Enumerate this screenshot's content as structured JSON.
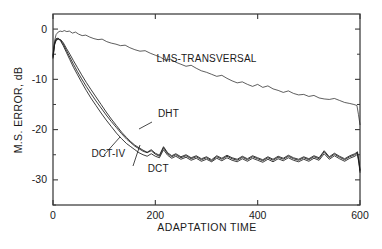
{
  "chart_data": {
    "type": "line",
    "title": "",
    "xlabel": "ADAPTATION TIME",
    "ylabel": "M.S. ERROR, dB",
    "xlim": [
      0,
      600
    ],
    "ylim": [
      -35,
      3
    ],
    "grid": false,
    "legend_position": "inline-annotations",
    "x_ticks": [
      0,
      200,
      400,
      600
    ],
    "x_tick_labels": [
      "0",
      "200",
      "400",
      "600"
    ],
    "y_ticks": [
      0,
      -10,
      -20,
      -30
    ],
    "y_tick_labels": [
      "0",
      "-10",
      "-20",
      "-30"
    ],
    "y_minor_ticks": [
      -5,
      -15,
      -25,
      -35
    ],
    "annotations": [
      {
        "text": "LMS-TRANSVERSAL",
        "x": 300,
        "y": -6.5
      },
      {
        "text": "DHT",
        "x": 205,
        "y": -17.5
      },
      {
        "text": "DCT-IV",
        "x": 75,
        "y": -25.5
      },
      {
        "text": "DCT",
        "x": 185,
        "y": -28.5
      }
    ],
    "series": [
      {
        "name": "LMS-TRANSVERSAL",
        "x": [
          0,
          3,
          6,
          10,
          14,
          18,
          22,
          27,
          32,
          38,
          44,
          50,
          57,
          64,
          72,
          80,
          88,
          96,
          105,
          114,
          123,
          132,
          141,
          150,
          160,
          170,
          180,
          190,
          200,
          210,
          220,
          230,
          240,
          250,
          260,
          270,
          280,
          290,
          300,
          310,
          320,
          330,
          340,
          350,
          360,
          370,
          380,
          390,
          400,
          410,
          420,
          430,
          440,
          450,
          460,
          470,
          480,
          490,
          500,
          510,
          520,
          530,
          540,
          550,
          560,
          570,
          580,
          588,
          594,
          597,
          600
        ],
        "values": [
          -5.2,
          -2.4,
          -1.1,
          -0.6,
          -0.4,
          -0.5,
          -0.3,
          -0.5,
          -0.4,
          -0.8,
          -0.6,
          -1.0,
          -1.3,
          -1.2,
          -1.6,
          -1.9,
          -2.1,
          -2.0,
          -2.5,
          -2.8,
          -3.0,
          -3.3,
          -3.2,
          -3.7,
          -4.1,
          -4.4,
          -4.3,
          -4.8,
          -5.2,
          -5.6,
          -6.2,
          -6.0,
          -6.6,
          -7.0,
          -7.4,
          -7.2,
          -7.8,
          -8.3,
          -8.6,
          -9.0,
          -9.4,
          -9.2,
          -9.8,
          -10.3,
          -10.7,
          -10.5,
          -11.0,
          -11.4,
          -11.0,
          -11.6,
          -11.3,
          -11.9,
          -12.2,
          -12.6,
          -12.3,
          -12.8,
          -13.1,
          -13.0,
          -13.4,
          -13.2,
          -13.7,
          -13.9,
          -14.0,
          -13.8,
          -14.2,
          -14.6,
          -14.8,
          -15.0,
          -15.2,
          -17.0,
          -19.0
        ]
      },
      {
        "name": "DHT",
        "x": [
          0,
          3,
          6,
          10,
          15,
          20,
          26,
          33,
          40,
          48,
          56,
          65,
          74,
          84,
          94,
          104,
          114,
          124,
          134,
          144,
          152,
          160,
          168,
          176,
          184,
          192,
          200,
          208,
          216,
          224,
          232,
          240,
          250,
          260,
          270,
          280,
          290,
          300,
          310,
          320,
          330,
          340,
          350,
          360,
          370,
          380,
          390,
          400,
          410,
          420,
          430,
          440,
          450,
          460,
          470,
          480,
          490,
          500,
          510,
          520,
          530,
          540,
          550,
          560,
          570,
          580,
          590,
          595,
          598,
          600
        ],
        "values": [
          -5.6,
          -3.0,
          -2.1,
          -1.9,
          -2.2,
          -3.0,
          -4.2,
          -5.6,
          -7.0,
          -8.5,
          -9.9,
          -11.4,
          -12.8,
          -14.3,
          -15.7,
          -17.1,
          -18.4,
          -19.6,
          -20.8,
          -21.9,
          -22.6,
          -23.3,
          -23.8,
          -24.3,
          -24.6,
          -24.2,
          -24.9,
          -25.3,
          -23.6,
          -24.8,
          -25.4,
          -25.0,
          -25.6,
          -25.2,
          -25.8,
          -25.4,
          -26.0,
          -25.6,
          -26.2,
          -25.4,
          -25.9,
          -25.3,
          -25.8,
          -26.1,
          -25.5,
          -26.0,
          -25.4,
          -25.8,
          -26.2,
          -25.6,
          -26.1,
          -25.5,
          -25.9,
          -25.3,
          -25.8,
          -26.1,
          -25.6,
          -26.0,
          -25.4,
          -25.8,
          -24.4,
          -25.6,
          -24.9,
          -25.5,
          -26.0,
          -25.4,
          -25.0,
          -24.6,
          -26.5,
          -28.2
        ]
      },
      {
        "name": "DCT",
        "x": [
          0,
          3,
          6,
          10,
          15,
          20,
          26,
          33,
          40,
          48,
          56,
          65,
          74,
          84,
          94,
          104,
          114,
          124,
          134,
          144,
          152,
          160,
          168,
          176,
          184,
          192,
          200,
          208,
          216,
          224,
          232,
          240,
          250,
          260,
          270,
          280,
          290,
          300,
          310,
          320,
          330,
          340,
          350,
          360,
          370,
          380,
          390,
          400,
          410,
          420,
          430,
          440,
          450,
          460,
          470,
          480,
          490,
          500,
          510,
          520,
          530,
          540,
          550,
          560,
          570,
          580,
          590,
          595,
          598,
          600
        ],
        "values": [
          -5.4,
          -2.8,
          -1.9,
          -1.8,
          -2.4,
          -3.3,
          -4.6,
          -6.1,
          -7.6,
          -9.1,
          -10.6,
          -12.2,
          -13.7,
          -15.2,
          -16.7,
          -18.1,
          -19.4,
          -20.7,
          -21.8,
          -22.8,
          -23.4,
          -24.0,
          -24.6,
          -25.0,
          -25.3,
          -24.8,
          -25.3,
          -25.6,
          -24.0,
          -25.1,
          -25.7,
          -25.3,
          -25.9,
          -25.5,
          -26.1,
          -25.7,
          -26.3,
          -25.9,
          -26.4,
          -25.7,
          -26.2,
          -25.6,
          -26.1,
          -26.4,
          -25.8,
          -26.3,
          -25.7,
          -26.1,
          -26.5,
          -25.9,
          -26.4,
          -25.8,
          -26.2,
          -25.6,
          -26.1,
          -26.4,
          -25.9,
          -26.3,
          -25.7,
          -26.1,
          -24.8,
          -25.9,
          -25.2,
          -25.8,
          -26.3,
          -25.7,
          -25.3,
          -24.9,
          -26.8,
          -28.5
        ]
      },
      {
        "name": "DCT-IV",
        "x": [
          0,
          3,
          6,
          10,
          15,
          20,
          26,
          33,
          40,
          48,
          56,
          65,
          74,
          84,
          94,
          104,
          114,
          124,
          134,
          144,
          152,
          160,
          168,
          176,
          184,
          192,
          200,
          208,
          216,
          224,
          232,
          240,
          250,
          260,
          270,
          280,
          290,
          300,
          310,
          320,
          330,
          340,
          350,
          360,
          370,
          380,
          390,
          400,
          410,
          420,
          430,
          440,
          450,
          460,
          470,
          480,
          490,
          500,
          510,
          520,
          530,
          540,
          550,
          560,
          570,
          580,
          590,
          595,
          598,
          600
        ],
        "values": [
          -5.8,
          -3.2,
          -2.3,
          -2.0,
          -2.1,
          -2.7,
          -3.8,
          -5.0,
          -6.3,
          -7.7,
          -9.1,
          -10.6,
          -12.0,
          -13.5,
          -15.0,
          -16.5,
          -17.9,
          -19.2,
          -20.5,
          -21.6,
          -22.4,
          -23.1,
          -23.6,
          -24.1,
          -24.5,
          -24.0,
          -24.7,
          -25.1,
          -23.4,
          -24.6,
          -25.2,
          -24.8,
          -25.4,
          -25.0,
          -25.6,
          -25.2,
          -25.8,
          -25.4,
          -26.0,
          -25.2,
          -25.7,
          -25.1,
          -25.6,
          -25.9,
          -25.3,
          -25.8,
          -25.2,
          -25.6,
          -26.0,
          -25.4,
          -25.9,
          -25.3,
          -25.7,
          -25.1,
          -25.6,
          -25.9,
          -25.4,
          -25.8,
          -25.2,
          -25.6,
          -24.2,
          -25.4,
          -24.7,
          -25.3,
          -25.8,
          -25.2,
          -24.8,
          -24.4,
          -26.3,
          -28.0
        ]
      }
    ]
  }
}
